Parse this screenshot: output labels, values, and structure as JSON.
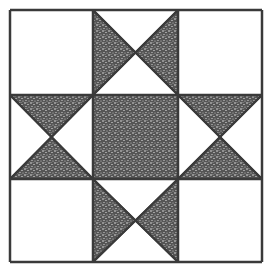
{
  "diagram": {
    "grid": {
      "rows": 3,
      "cols": 3,
      "x_lines": [
        10,
        93,
        178,
        262
      ],
      "y_lines": [
        10,
        95,
        179,
        262
      ]
    },
    "colors": {
      "background": "#ffffff",
      "stroke": "#3a3a3a",
      "fill_dark": "#2e2e2e",
      "fill_light": "#ffffff"
    },
    "cells": [
      {
        "row": 0,
        "col": 0,
        "type": "plain"
      },
      {
        "row": 0,
        "col": 1,
        "type": "hourglass-vertical",
        "shaded": [
          "left",
          "right"
        ]
      },
      {
        "row": 0,
        "col": 2,
        "type": "plain"
      },
      {
        "row": 1,
        "col": 0,
        "type": "hourglass-horizontal",
        "shaded": [
          "top",
          "bottom"
        ]
      },
      {
        "row": 1,
        "col": 1,
        "type": "solid"
      },
      {
        "row": 1,
        "col": 2,
        "type": "hourglass-horizontal",
        "shaded": [
          "top",
          "bottom"
        ]
      },
      {
        "row": 2,
        "col": 0,
        "type": "plain"
      },
      {
        "row": 2,
        "col": 1,
        "type": "hourglass-vertical",
        "shaded": [
          "left",
          "right"
        ]
      },
      {
        "row": 2,
        "col": 2,
        "type": "plain"
      }
    ]
  }
}
